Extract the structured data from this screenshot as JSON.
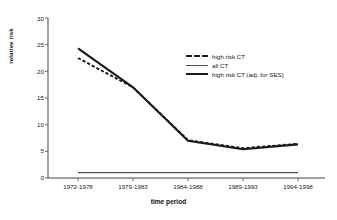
{
  "chart_data": {
    "type": "line",
    "title": "",
    "xlabel": "time period",
    "ylabel": "relative risk",
    "categories": [
      "1972-1978",
      "1979-1983",
      "1984-1988",
      "1989-1993",
      "1994-1998"
    ],
    "ylim": [
      0,
      30
    ],
    "yticks": [
      0,
      5,
      10,
      15,
      20,
      25,
      30
    ],
    "grid": false,
    "legend_position": "inside-upper-right",
    "series": [
      {
        "name": "high risk CT",
        "style": "dashed",
        "color": "#1a1a1a",
        "values": [
          22.5,
          17.0,
          7.1,
          5.6,
          6.4
        ]
      },
      {
        "name": "all CT",
        "style": "thin-solid",
        "color": "#555555",
        "values": [
          1.0,
          1.0,
          1.0,
          1.0,
          1.0
        ]
      },
      {
        "name": "high risk CT (adj. for SES)",
        "style": "thick-solid",
        "color": "#1a1a1a",
        "values": [
          24.3,
          17.0,
          7.0,
          5.4,
          6.3
        ]
      }
    ]
  },
  "axis": {
    "y_label": "relative risk",
    "x_label": "time period",
    "y_tick_labels": [
      "0",
      "5",
      "10",
      "15",
      "20",
      "25",
      "30"
    ],
    "x_tick_labels": [
      "1972-1978",
      "1979-1983",
      "1984-1988",
      "1989-1993",
      "1994-1998"
    ]
  },
  "legend": {
    "items": [
      {
        "label": "high risk CT"
      },
      {
        "label": "all CT"
      },
      {
        "label": "high risk CT (adj. for SES)"
      }
    ]
  }
}
